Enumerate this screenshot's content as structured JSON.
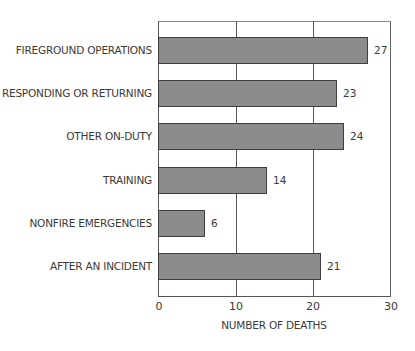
{
  "chart_data": {
    "type": "bar",
    "orientation": "horizontal",
    "title": "",
    "categories": [
      "FIREGROUND OPERATIONS",
      "RESPONDING OR RETURNING",
      "OTHER ON-DUTY",
      "TRAINING",
      "NONFIRE EMERGENCIES",
      "AFTER AN INCIDENT"
    ],
    "values": [
      27,
      23,
      24,
      14,
      6,
      21
    ],
    "value_labels": [
      "27",
      "23",
      "24",
      "14",
      "6",
      "21"
    ],
    "xlabel": "NUMBER OF DEATHS",
    "ylabel": "",
    "xlim": [
      0,
      30
    ],
    "xticks": [
      "0",
      "10",
      "20",
      "30"
    ],
    "grid": true,
    "legend": null,
    "bar_color": "#8c8c8c",
    "bar_edge_color": "#3f3f3f"
  }
}
